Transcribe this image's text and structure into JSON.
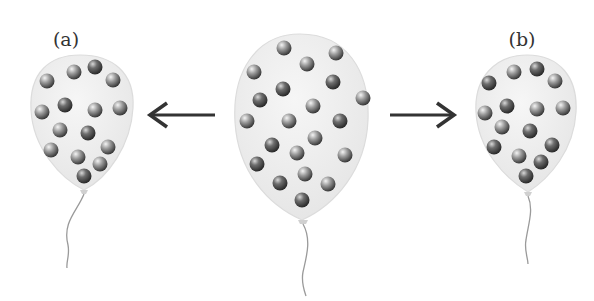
{
  "figure": {
    "labels": {
      "left": "(a)",
      "right": "(b)"
    },
    "balloons": [
      {
        "id": "a",
        "label": "(a)",
        "molecule_count": 15,
        "size": "small"
      },
      {
        "id": "center",
        "label": "",
        "molecule_count": 21,
        "size": "large"
      },
      {
        "id": "b",
        "label": "(b)",
        "molecule_count": 15,
        "size": "small"
      }
    ],
    "arrows": [
      {
        "direction": "left",
        "from": "center",
        "to": "a"
      },
      {
        "direction": "right",
        "from": "center",
        "to": "b"
      }
    ],
    "colors": {
      "balloon_fill": "#eeeeee",
      "balloon_stroke": "#dcdcdc",
      "molecule_light": "#f2f2f2",
      "molecule_dark": "#3a3a3a",
      "arrow": "#333333",
      "string": "#9a9a9a",
      "label": "#333333"
    }
  }
}
